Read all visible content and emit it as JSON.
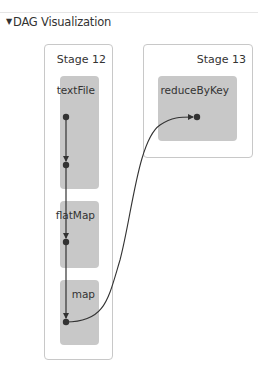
{
  "section": {
    "title": "DAG Visualization",
    "toggle_icon": "triangle-down-icon"
  },
  "stages": [
    {
      "label": "Stage 12",
      "rdds": [
        {
          "label": "textFile"
        },
        {
          "label": "flatMap"
        },
        {
          "label": "map"
        }
      ]
    },
    {
      "label": "Stage 13",
      "rdds": [
        {
          "label": "reduceByKey"
        }
      ]
    }
  ],
  "colors": {
    "stage_border": "#c8c8c8",
    "rdd_fill": "#c8c8c8",
    "edge": "#333333",
    "node": "#333333"
  }
}
